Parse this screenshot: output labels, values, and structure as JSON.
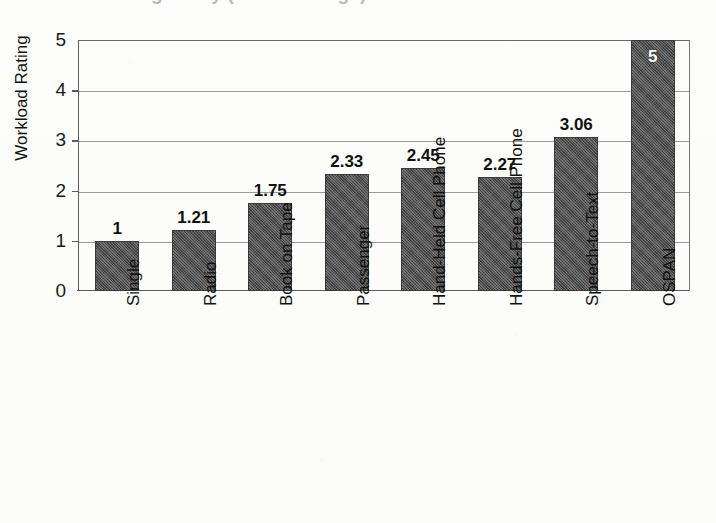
{
  "figure": {
    "title_cutoff": "Driving Study (Mean Ratings)",
    "background_color": "#fdfdfb",
    "bar_color": "#4e4e4e",
    "axis_color": "#5d5d5d",
    "gridline_color": "#9b9b9b"
  },
  "chart_data": {
    "type": "bar",
    "title": "",
    "xlabel": "",
    "ylabel": "Workload Rating",
    "ylim": [
      0,
      5
    ],
    "yticks": [
      0,
      1,
      2,
      3,
      4,
      5
    ],
    "grid": true,
    "legend": false,
    "orientation": "vertical",
    "value_label_position": "above-bar (white inside bar for OSPAN)",
    "categories": [
      "Single",
      "Radio",
      "Book on Tape",
      "Passenger",
      "Hand-Held Cell Phone",
      "Hands-Free Cell Phone",
      "Speech-to-Text",
      "OSPAN"
    ],
    "values": [
      1,
      1.21,
      1.75,
      2.33,
      2.45,
      2.27,
      3.06,
      5
    ],
    "value_labels": [
      "1",
      "1.21",
      "1.75",
      "2.33",
      "2.45",
      "2.27",
      "3.06",
      "5"
    ]
  }
}
